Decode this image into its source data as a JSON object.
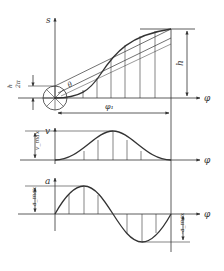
{
  "diagram": {
    "displacement": {
      "axis_y_label": "s",
      "axis_x_label": "φ",
      "rise_label": "h",
      "small_rise_label_num": "h",
      "small_rise_label_den": "2π",
      "angle_label": "θ",
      "period_label": "φ₁"
    },
    "velocity": {
      "axis_y_label": "v",
      "axis_x_label": "φ",
      "max_label": "v_max"
    },
    "acceleration": {
      "axis_y_label": "a",
      "axis_x_label": "φ",
      "max_label": "a_max",
      "min_label": "-a_max"
    }
  }
}
